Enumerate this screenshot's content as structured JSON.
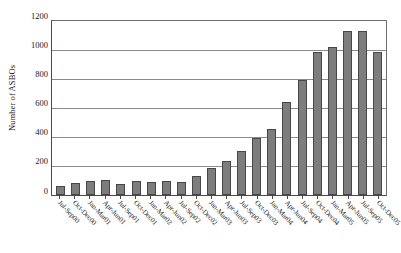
{
  "chart_data": {
    "type": "bar",
    "title": "",
    "xlabel": "",
    "ylabel": "Number of ASBOs",
    "ylim": [
      0,
      1200
    ],
    "yticks": [
      0,
      200,
      400,
      600,
      800,
      1000,
      1200
    ],
    "grid": true,
    "legend": false,
    "bar_color": "#7d7d7d",
    "bar_edge_color": "#474747",
    "categories": [
      "Jul-Sep00",
      "Oct-Dec00",
      "Jan-Mar01",
      "Apr-Jun01",
      "Jul-Sep01",
      "Oct-Dec01",
      "Jan-Mar02",
      "Apr-Jun02",
      "Jul-Sep02",
      "Oct-Dec02",
      "Jan-Mar03",
      "Apr-Jun03",
      "Jul-Sep03",
      "Oct-Dec03",
      "Jan-Mar04",
      "Apr-Jun04",
      "Jul-Sep04",
      "Oct-Dec04",
      "Jan-Mar05",
      "Apr-Jun05",
      "Jul-Sep05",
      "Oct-Dec05"
    ],
    "values": [
      60,
      80,
      90,
      100,
      75,
      95,
      85,
      95,
      85,
      130,
      180,
      230,
      300,
      390,
      450,
      640,
      790,
      980,
      1020,
      1130,
      1125,
      980
    ]
  },
  "axis": {
    "y_title": "Number of ASBOs"
  }
}
